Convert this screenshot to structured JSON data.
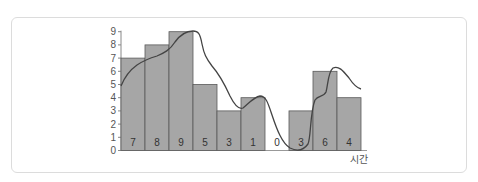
{
  "chart_data": {
    "type": "bar",
    "title": "",
    "xlabel": "시간",
    "ylabel": "",
    "ylim": [
      0,
      9
    ],
    "yticks": [
      0,
      1,
      2,
      3,
      4,
      5,
      6,
      7,
      8,
      9
    ],
    "categories": [
      "1",
      "2",
      "3",
      "4",
      "5",
      "6",
      "7",
      "8",
      "9",
      "10"
    ],
    "bar_labels": [
      "7",
      "8",
      "9",
      "5",
      "3",
      "1",
      "0",
      "3",
      "6",
      "4"
    ],
    "values": [
      7,
      8,
      9,
      5,
      3,
      4,
      0,
      3,
      6,
      4
    ],
    "overlay": {
      "type": "line",
      "style": "smooth curve",
      "description": "Smooth wavy curve overlaid on the bars, roughly tracking bar heights"
    },
    "grid": false,
    "legend": null,
    "colors": {
      "bar": "#a6a6a6",
      "bar_edge": "#555555",
      "curve": "#444444",
      "axis": "#888888"
    }
  }
}
